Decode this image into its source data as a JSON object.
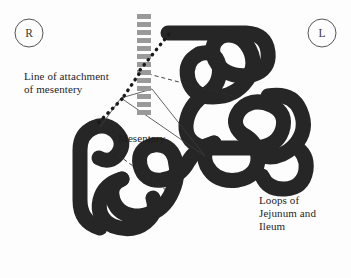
{
  "figure": {
    "title_visible": false,
    "background_color": "#fdfdfd",
    "bowel_color": "#262626",
    "mesentery_line_color": "#3c3c3c",
    "attachment_dash_color": "#9a9a9a",
    "leader_dot_color": "#1a1a1a",
    "text_color": "#1d1d1d"
  },
  "orientation_markers": [
    {
      "id": "right",
      "label": "R",
      "cx": 29,
      "cy": 33,
      "r": 14
    },
    {
      "id": "left",
      "label": "L",
      "cx": 322,
      "cy": 33,
      "r": 14
    }
  ],
  "labels": {
    "line_of_attachment": "Line of attachment\nof mesentery",
    "mesentery": "Mesentery",
    "loops": "Loops of\nJejunum and\nIleum"
  },
  "annotations": [
    {
      "name": "line-of-attachment-of-mesentery",
      "text": "Line of attachment\nof mesentery",
      "x": 24,
      "y": 72,
      "leader_style": "thick-dotted",
      "targets": [
        "vertical-dashed-band"
      ]
    },
    {
      "name": "mesentery",
      "text": "Mesentery",
      "x": 118,
      "y": 134,
      "leader_style": "thin-solid",
      "targets": [
        "mesentery-fan"
      ]
    },
    {
      "name": "loops-of-jejunum-and-ileum",
      "text": "Loops of\nJejunum and\nIleum",
      "x": 259,
      "y": 196,
      "leader_style": "none",
      "targets": [
        "bowel-loops"
      ]
    }
  ],
  "attachment_band": {
    "name": "vertical-dashed-band",
    "x": 137,
    "y_start": 14,
    "y_end": 116,
    "dash_width": 14,
    "dash_height": 5,
    "dash_gap": 3,
    "color": "#9a9a9a"
  },
  "chart_data": {
    "type": "diagram",
    "elements": [
      "R orientation marker",
      "L orientation marker",
      "Line of attachment of mesentery (vertical dashed band)",
      "Mesentery (thin fan lines)",
      "Loops of jejunum and ileum (thick convoluted tube)"
    ]
  }
}
